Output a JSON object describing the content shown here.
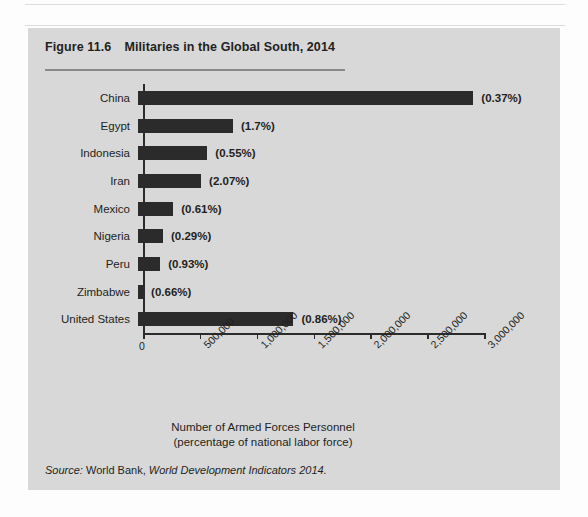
{
  "figure": {
    "number": "Figure 11.6",
    "title": "Militaries in the Global South, 2014",
    "source_prefix": "Source:",
    "source_org": "World Bank,",
    "source_publication": "World Development Indicators 2014.",
    "panel_color": "#d8d8d8",
    "bar_color": "#2b2b2b",
    "text_color": "#231f20"
  },
  "chart_data": {
    "type": "bar",
    "orientation": "horizontal",
    "title": "Militaries in the Global South, 2014",
    "xlabel_line1": "Number of Armed Forces Personnel",
    "xlabel_line2": "(percentage of national labor force)",
    "ylabel": "",
    "xlim": [
      0,
      3000000
    ],
    "grid": false,
    "legend": "none",
    "tick_labels": [
      "0",
      "500,000",
      "1,000,000",
      "1,500,000",
      "2,000,000",
      "2,500,000",
      "3,000,000"
    ],
    "tick_values": [
      0,
      500000,
      1000000,
      1500000,
      2000000,
      2500000,
      3000000
    ],
    "categories": [
      "China",
      "Egypt",
      "Indonesia",
      "Iran",
      "Mexico",
      "Nigeria",
      "Peru",
      "Zimbabwe",
      "United States"
    ],
    "values": [
      2950000,
      835000,
      610000,
      555000,
      310000,
      220000,
      195000,
      45000,
      1367000
    ],
    "data_labels": [
      "(0.37%)",
      "(1.7%)",
      "(0.55%)",
      "(2.07%)",
      "(0.61%)",
      "(0.29%)",
      "(0.93%)",
      "(0.66%)",
      "(0.86%)"
    ],
    "bars": [
      {
        "category": "China",
        "value": 2950000,
        "label": "(0.37%)"
      },
      {
        "category": "Egypt",
        "value": 835000,
        "label": "(1.7%)"
      },
      {
        "category": "Indonesia",
        "value": 610000,
        "label": "(0.55%)"
      },
      {
        "category": "Iran",
        "value": 555000,
        "label": "(2.07%)"
      },
      {
        "category": "Mexico",
        "value": 310000,
        "label": "(0.61%)"
      },
      {
        "category": "Nigeria",
        "value": 220000,
        "label": "(0.29%)"
      },
      {
        "category": "Peru",
        "value": 195000,
        "label": "(0.93%)"
      },
      {
        "category": "Zimbabwe",
        "value": 45000,
        "label": "(0.66%)"
      },
      {
        "category": "United States",
        "value": 1367000,
        "label": "(0.86%)"
      }
    ]
  }
}
